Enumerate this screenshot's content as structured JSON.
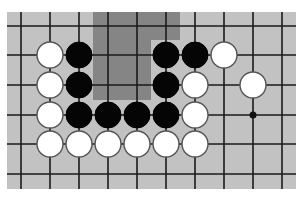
{
  "diagram": {
    "type": "go-board-fragment",
    "board": {
      "x": 7,
      "y": 12,
      "width": 289,
      "height": 177,
      "color": "#c2c2c2"
    },
    "grid": {
      "columns": [
        21,
        50,
        79,
        108,
        137,
        166,
        195,
        224,
        253,
        282
      ],
      "rows": [
        26,
        55,
        85,
        115,
        144,
        174
      ],
      "line_color": "#1a1a1a"
    },
    "shaded_region": {
      "color": "#858585",
      "polygon": [
        [
          93,
          12
        ],
        [
          180,
          12
        ],
        [
          180,
          40
        ],
        [
          151,
          40
        ],
        [
          151,
          100
        ],
        [
          93,
          100
        ]
      ]
    },
    "stone_radius": 13,
    "stones": [
      {
        "color": "white",
        "col": 1,
        "row": 1
      },
      {
        "color": "black",
        "col": 2,
        "row": 1
      },
      {
        "color": "black",
        "col": 5,
        "row": 1
      },
      {
        "color": "black",
        "col": 6,
        "row": 1
      },
      {
        "color": "white",
        "col": 7,
        "row": 1
      },
      {
        "color": "white",
        "col": 1,
        "row": 2
      },
      {
        "color": "black",
        "col": 2,
        "row": 2
      },
      {
        "color": "black",
        "col": 5,
        "row": 2
      },
      {
        "color": "white",
        "col": 6,
        "row": 2
      },
      {
        "color": "white",
        "col": 8,
        "row": 2
      },
      {
        "color": "white",
        "col": 1,
        "row": 3
      },
      {
        "color": "black",
        "col": 2,
        "row": 3
      },
      {
        "color": "black",
        "col": 3,
        "row": 3
      },
      {
        "color": "black",
        "col": 4,
        "row": 3
      },
      {
        "color": "black",
        "col": 5,
        "row": 3
      },
      {
        "color": "white",
        "col": 6,
        "row": 3
      },
      {
        "color": "white",
        "col": 1,
        "row": 4
      },
      {
        "color": "white",
        "col": 2,
        "row": 4
      },
      {
        "color": "white",
        "col": 3,
        "row": 4
      },
      {
        "color": "white",
        "col": 4,
        "row": 4
      },
      {
        "color": "white",
        "col": 5,
        "row": 4
      },
      {
        "color": "white",
        "col": 6,
        "row": 4
      }
    ],
    "star_points": [
      {
        "col": 8,
        "row": 3
      }
    ]
  }
}
